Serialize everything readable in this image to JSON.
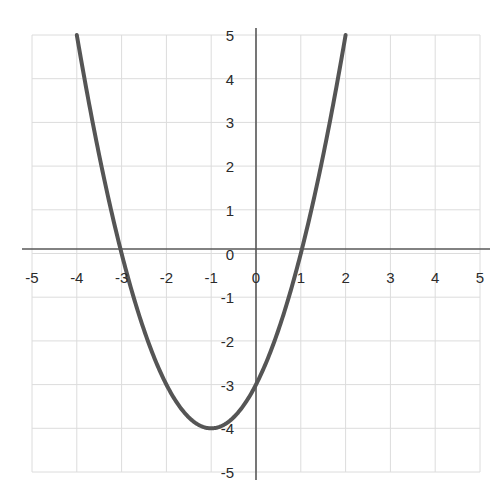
{
  "figure": {
    "name": "parabola-graph",
    "background_color": "#ffffff",
    "grid_color": "#dcdcdc",
    "axis_color": "#585858",
    "curve_color": "#555555",
    "label_color": "#2b2b2b"
  },
  "chart_data": {
    "type": "line",
    "title": "",
    "subtitle": "",
    "xlabel": "",
    "ylabel": "",
    "xlim": [
      -5,
      5
    ],
    "ylim": [
      -5,
      5
    ],
    "grid": true,
    "legend": false,
    "legend_position": "none",
    "x_ticks": [
      -5,
      -4,
      -3,
      -2,
      -1,
      0,
      1,
      2,
      3,
      4,
      5
    ],
    "y_ticks": [
      5,
      4,
      3,
      2,
      1,
      0,
      -1,
      -2,
      -3,
      -4,
      -5
    ],
    "x_tick_labels": [
      "-5",
      "-4",
      "-3",
      "-2",
      "-1",
      "0",
      "1",
      "2",
      "3",
      "4",
      "5"
    ],
    "y_tick_labels": [
      "5",
      "4",
      "3",
      "2",
      "1",
      "0",
      "-1",
      "-2",
      "-3",
      "-4",
      "-5"
    ],
    "series": [
      {
        "name": "y = x^2 + 2x - 3",
        "equation": "y = x^2 + 2x - 3",
        "vertex": [
          -1,
          -4
        ],
        "roots": [
          -3,
          1
        ],
        "y_intercept": -3,
        "color": "#555555",
        "line_width": 4,
        "x": [
          -4,
          -3.75,
          -3.5,
          -3.25,
          -3,
          -2.75,
          -2.5,
          -2.25,
          -2,
          -1.75,
          -1.5,
          -1.25,
          -1,
          -0.75,
          -0.5,
          -0.25,
          0,
          0.25,
          0.5,
          0.75,
          1,
          1.25,
          1.5,
          1.75,
          2
        ],
        "values": [
          5,
          3.5625,
          2.25,
          1.0625,
          0,
          -0.9375,
          -1.75,
          -2.4375,
          -3,
          -3.4375,
          -3.75,
          -3.9375,
          -4,
          -3.9375,
          -3.75,
          -3.4375,
          -3,
          -2.4375,
          -1.75,
          -0.9375,
          0,
          1.0625,
          2.25,
          3.5625,
          5
        ]
      }
    ]
  }
}
